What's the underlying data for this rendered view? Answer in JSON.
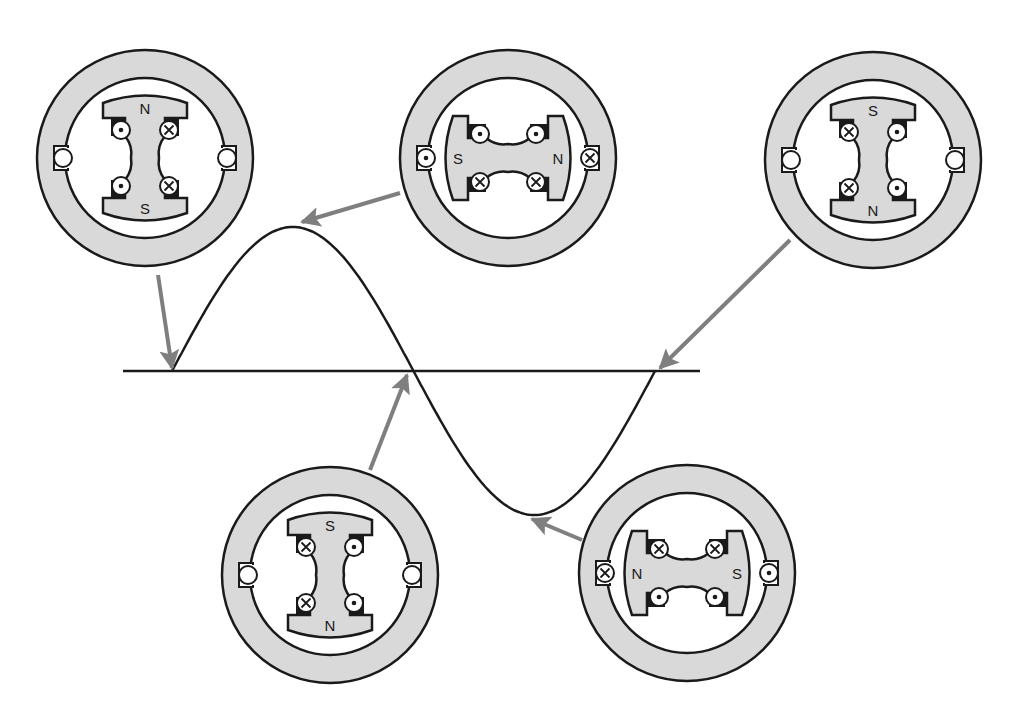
{
  "figure": {
    "colors": {
      "background": "#ffffff",
      "stroke": "#1a1a1a",
      "fill_gray": "#d9d9d9",
      "arrow": "#7f7f7f"
    },
    "axis": {
      "x1": 123,
      "x2": 700,
      "y": 371
    },
    "wave": {
      "start_x": 172,
      "peak": [
        288,
        227
      ],
      "mid_cross_x": 408,
      "trough": [
        530,
        515
      ],
      "end_cross_x": 655
    }
  },
  "rotors": [
    {
      "id": "rotor-0deg",
      "cx": 145,
      "cy": 158,
      "orientation": "vertical",
      "pole_a": "N",
      "pole_b": "S",
      "coil_marks": [
        "dot",
        "cross",
        "dot",
        "cross"
      ],
      "brush_marks": [
        "ring",
        "ring"
      ],
      "arrow": {
        "from": [
          158,
          275
        ],
        "to": [
          172,
          368
        ]
      }
    },
    {
      "id": "rotor-90deg",
      "cx": 508,
      "cy": 158,
      "orientation": "horizontal",
      "pole_a": "S",
      "pole_b": "N",
      "coil_marks": [
        "dot",
        "dot",
        "cross",
        "cross"
      ],
      "brush_marks": [
        "dot",
        "cross"
      ],
      "arrow": {
        "from": [
          400,
          193
        ],
        "to": [
          302,
          222
        ]
      }
    },
    {
      "id": "rotor-360deg",
      "cx": 873,
      "cy": 160,
      "orientation": "vertical",
      "pole_a": "S",
      "pole_b": "N",
      "coil_marks": [
        "cross",
        "dot",
        "cross",
        "dot"
      ],
      "brush_marks": [
        "ring",
        "ring"
      ],
      "arrow": {
        "from": [
          790,
          240
        ],
        "to": [
          660,
          368
        ]
      }
    },
    {
      "id": "rotor-180deg",
      "cx": 330,
      "cy": 575,
      "orientation": "vertical",
      "pole_a": "S",
      "pole_b": "N",
      "coil_marks": [
        "cross",
        "dot",
        "cross",
        "dot"
      ],
      "brush_marks": [
        "ring",
        "ring"
      ],
      "arrow": {
        "from": [
          370,
          470
        ],
        "to": [
          407,
          375
        ]
      }
    },
    {
      "id": "rotor-270deg",
      "cx": 687,
      "cy": 573,
      "orientation": "horizontal",
      "pole_a": "N",
      "pole_b": "S",
      "coil_marks": [
        "cross",
        "cross",
        "dot",
        "dot"
      ],
      "brush_marks": [
        "cross",
        "dot"
      ],
      "arrow": {
        "from": [
          582,
          540
        ],
        "to": [
          532,
          519
        ]
      }
    }
  ]
}
